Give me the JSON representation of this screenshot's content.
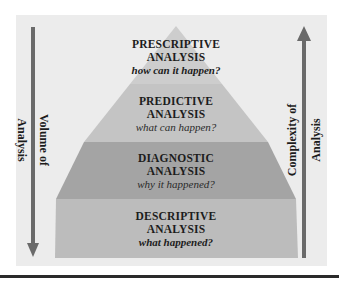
{
  "diagram": {
    "tiers": [
      {
        "label": "PRESCRIPTIVE",
        "sub": "ANALYSIS",
        "question": "how can it happen?",
        "color": "#cdcdcd"
      },
      {
        "label": "PREDICTIVE",
        "sub": "ANALYSIS",
        "question": "what can happen?",
        "color": "#c4c4c4"
      },
      {
        "label": "DIAGNOSTIC",
        "sub": "ANALYSIS",
        "question": "why it happened?",
        "color": "#a4a4a4"
      },
      {
        "label": "DESCRIPTIVE",
        "sub": "ANALYSIS",
        "question": "what happened?",
        "color": "#bcbcbc"
      }
    ],
    "left_axis": {
      "line1": "Volume of",
      "line2": "Analysis",
      "direction": "down"
    },
    "right_axis": {
      "line1": "Complexity of",
      "line2": "Analysis",
      "direction": "up"
    },
    "colors": {
      "panel": "#ececec",
      "arrow": "#6a6a6a",
      "rule": "#2a2a2a"
    }
  }
}
